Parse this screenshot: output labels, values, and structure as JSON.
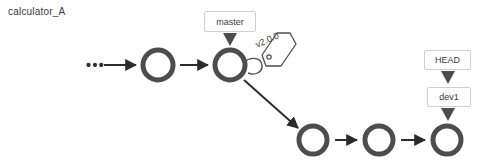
{
  "title": "calculator_A",
  "colors": {
    "commit_ring": "#4d4d4d",
    "arrow": "#2b2b2b",
    "ref_border": "#cfcfcf",
    "ref_text": "#3c3c3c",
    "tag_outline": "#4d4d4d",
    "background": "#ffffff"
  },
  "graph": {
    "truncation_indicator": "•••",
    "commits": [
      {
        "id": "commit-1",
        "branch": "master",
        "cx": 158,
        "cy": 65
      },
      {
        "id": "commit-2",
        "branch": "master",
        "cx": 230,
        "cy": 65
      },
      {
        "id": "commit-3",
        "branch": "dev1",
        "cx": 313,
        "cy": 140
      },
      {
        "id": "commit-4",
        "branch": "dev1",
        "cx": 379,
        "cy": 140
      },
      {
        "id": "commit-5",
        "branch": "dev1",
        "cx": 447,
        "cy": 140
      }
    ],
    "edges": [
      {
        "from": "ellipsis",
        "to": "commit-1"
      },
      {
        "from": "commit-1",
        "to": "commit-2"
      },
      {
        "from": "commit-2",
        "to": "commit-3"
      },
      {
        "from": "commit-3",
        "to": "commit-4"
      },
      {
        "from": "commit-4",
        "to": "commit-5"
      }
    ]
  },
  "refs": {
    "master": {
      "label": "master",
      "points_to": "commit-2"
    },
    "head": {
      "label": "HEAD",
      "points_to": "dev1"
    },
    "dev1": {
      "label": "dev1",
      "points_to": "commit-5"
    }
  },
  "tags": {
    "v200": {
      "label": "v2.0.0",
      "attached_to": "commit-2"
    }
  }
}
